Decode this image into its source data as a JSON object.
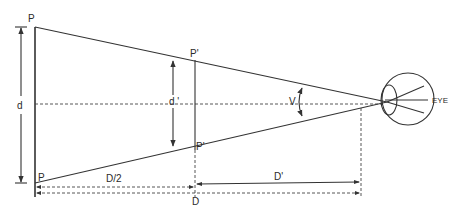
{
  "diagram": {
    "colors": {
      "stroke": "#333333",
      "text": "#2a2a2a",
      "background": "#ffffff"
    },
    "labels": {
      "object_top": "P",
      "object_bottom": "P",
      "image_top": "P'",
      "image_bottom": "P'",
      "object_size": "d",
      "image_size": "d '",
      "visual_angle": "V",
      "eye": "EYE",
      "half_distance": "D/2",
      "near_distance": "D'",
      "full_distance": "D"
    }
  }
}
